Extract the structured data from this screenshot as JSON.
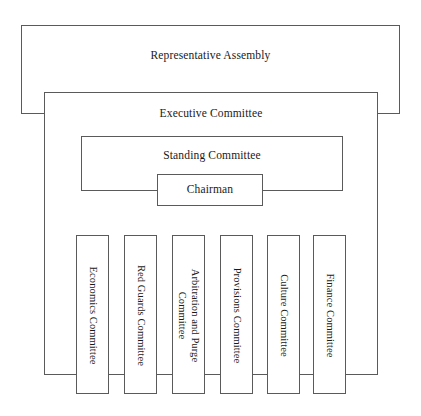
{
  "diagram": {
    "line_color": "#5a5a5a",
    "background_color": "#ffffff",
    "text_color": "#1a1a1a"
  },
  "levels": {
    "assembly": {
      "label": "Representative Assembly"
    },
    "executive": {
      "label": "Executive Committee"
    },
    "standing": {
      "label": "Standing Committee"
    },
    "chairman": {
      "label": "Chairman"
    }
  },
  "sub_committees": [
    {
      "label": "Economics Committee"
    },
    {
      "label": "Red Guards Committee"
    },
    {
      "label": "Arbitration and Purge\nCommittee"
    },
    {
      "label": "Provisions Committee"
    },
    {
      "label": "Culture Committee"
    },
    {
      "label": "Finance Committee"
    }
  ]
}
